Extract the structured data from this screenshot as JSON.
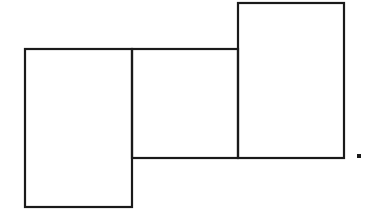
{
  "figure": {
    "stroke_color": "#1a1a1a",
    "background": "#ffffff",
    "shapes": [
      {
        "id": "left-rect",
        "x": 24,
        "y": 48,
        "width": 108,
        "height": 159
      },
      {
        "id": "middle-rect",
        "x": 132,
        "y": 48,
        "width": 106,
        "height": 110
      },
      {
        "id": "right-rect",
        "x": 238,
        "y": 2,
        "width": 107,
        "height": 156
      }
    ],
    "period": {
      "x": 357,
      "y": 155,
      "size": 3
    }
  }
}
